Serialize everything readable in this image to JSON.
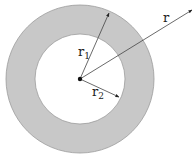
{
  "diagram": {
    "type": "annulus",
    "colors": {
      "ring_fill": "#c8c8c8",
      "ring_stroke": "#9a9a9a",
      "inner_fill": "#ffffff",
      "line": "#444444",
      "center_dot": "#111111"
    },
    "center": {
      "x": 80,
      "y": 79
    },
    "outer_radius": 74,
    "inner_radius": 45,
    "labels": {
      "r1": {
        "base": "r",
        "sub": "1"
      },
      "r2": {
        "base": "r",
        "sub": "2"
      },
      "r": {
        "base": "r"
      }
    },
    "arrows": [
      {
        "name": "r1",
        "to": {
          "x": 109,
          "y": 13
        },
        "description": "outer radius r1"
      },
      {
        "name": "r2",
        "to": {
          "x": 119,
          "y": 97
        },
        "description": "inner radius r2"
      },
      {
        "name": "r",
        "to": {
          "x": 192,
          "y": 10
        },
        "description": "general radius r"
      }
    ]
  }
}
